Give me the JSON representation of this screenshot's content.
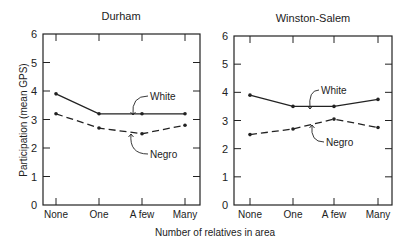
{
  "figure": {
    "xlabel": "Number of relatives in area",
    "ylabel": "Participation (mean GPS)"
  },
  "chart_data": [
    {
      "type": "line",
      "title": "Durham",
      "categories": [
        "None",
        "One",
        "A few",
        "Many"
      ],
      "xlabel": "Number of relatives in area",
      "ylabel": "Participation (mean GPS)",
      "ylim": [
        0,
        6
      ],
      "yticks": [
        0,
        1,
        2,
        3,
        4,
        5,
        6
      ],
      "grid": false,
      "legend": "inline annotations",
      "series": [
        {
          "name": "White",
          "style": "solid",
          "values": [
            3.9,
            3.2,
            3.2,
            3.2
          ]
        },
        {
          "name": "Negro",
          "style": "dashed",
          "values": [
            3.2,
            2.7,
            2.5,
            2.8
          ]
        }
      ]
    },
    {
      "type": "line",
      "title": "Winston-Salem",
      "categories": [
        "None",
        "One",
        "A few",
        "Many"
      ],
      "xlabel": "Number of relatives in area",
      "ylabel": "Participation (mean GPS)",
      "ylim": [
        0,
        6
      ],
      "yticks": [
        0,
        1,
        2,
        3,
        4,
        5,
        6
      ],
      "grid": false,
      "legend": "inline annotations",
      "series": [
        {
          "name": "White",
          "style": "solid",
          "values": [
            3.9,
            3.5,
            3.5,
            3.75
          ]
        },
        {
          "name": "Negro",
          "style": "dashed",
          "values": [
            2.5,
            2.7,
            3.05,
            2.75
          ]
        }
      ]
    }
  ],
  "colors": {
    "line": "#222222",
    "background": "#ffffff"
  }
}
